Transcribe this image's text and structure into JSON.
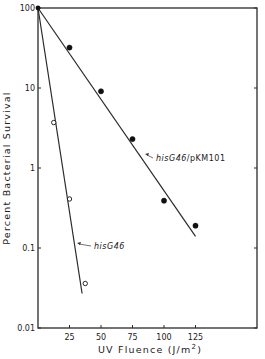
{
  "chart_data": {
    "type": "scatter",
    "title": "",
    "xlabel": "UV Fluence (J/m2)",
    "xlabel_display": {
      "main": "UV Fluence (J/m",
      "sup": "2",
      "end": ")"
    },
    "ylabel": "Percent Bacterial Survival",
    "yscale": "log",
    "xlim": [
      0,
      165
    ],
    "ylim": [
      0.01,
      100
    ],
    "x_ticks": [
      25,
      50,
      75,
      100,
      125
    ],
    "x_tick_labels": [
      "25",
      "50",
      "75",
      "100",
      "125"
    ],
    "y_ticks": [
      100,
      10,
      1,
      0.1,
      0.01
    ],
    "y_tick_labels": [
      "100",
      "10",
      "1",
      "0.1",
      "0.01"
    ],
    "grid": false,
    "legend": null,
    "series": [
      {
        "name": "hisG46/pKM101",
        "label_italic": "hisG46",
        "label_plain": "/pKM101",
        "marker": "filled-circle",
        "x": [
          0,
          25,
          50,
          75,
          100,
          125
        ],
        "y": [
          100,
          32,
          9.1,
          2.3,
          0.39,
          0.19
        ],
        "fit_line": {
          "x": [
            0,
            125
          ],
          "y": [
            100,
            0.14
          ]
        }
      },
      {
        "name": "hisG46",
        "label_italic": "hisG46",
        "label_plain": "",
        "marker": "open-circle",
        "x": [
          0,
          12.5,
          25,
          37.5
        ],
        "y": [
          100,
          3.7,
          0.41,
          0.036
        ],
        "fit_line": {
          "x": [
            0,
            35
          ],
          "y": [
            100,
            0.027
          ]
        }
      }
    ],
    "annotations": [
      {
        "text": "hisG46/pKM101",
        "arrow_to_series": "hisG46/pKM101"
      },
      {
        "text": "hisG46",
        "arrow_to_series": "hisG46"
      }
    ]
  }
}
